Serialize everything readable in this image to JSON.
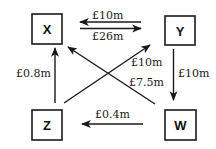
{
  "title": "",
  "nodes": [
    {
      "id": "X",
      "label": "X"
    },
    {
      "id": "Y",
      "label": "Y"
    },
    {
      "id": "Z",
      "label": "Z"
    },
    {
      "id": "W",
      "label": "W"
    }
  ],
  "flows": [
    {
      "id": "y-to-x",
      "from": "Y",
      "to": "X",
      "label": "£10m"
    },
    {
      "id": "x-to-y",
      "from": "X",
      "to": "Y",
      "label": "£26m"
    },
    {
      "id": "z-to-x",
      "from": "Z",
      "to": "X",
      "label": "£0.8m"
    },
    {
      "id": "y-to-w",
      "from": "Y",
      "to": "W",
      "label": "£10m"
    },
    {
      "id": "z-to-y",
      "from": "Z",
      "to": "Y",
      "label": "£10m"
    },
    {
      "id": "w-to-x",
      "from": "W",
      "to": "X",
      "label": "£7.5m"
    },
    {
      "id": "w-to-z",
      "from": "W",
      "to": "Z",
      "label": "£0.4m"
    }
  ],
  "colors": {
    "line": "#1a1a1a",
    "box": "#1a1a1a",
    "background": "#ffffff"
  }
}
